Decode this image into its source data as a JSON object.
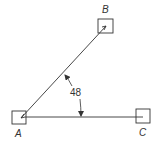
{
  "diagram": {
    "type": "angle-measurement",
    "points": {
      "A": {
        "label": "A"
      },
      "B": {
        "label": "B"
      },
      "C": {
        "label": "C"
      }
    },
    "angle": {
      "vertex": "A",
      "between": [
        "AB",
        "AC"
      ],
      "value": "48"
    },
    "colors": {
      "line": "#333333",
      "background": "#ffffff"
    }
  }
}
